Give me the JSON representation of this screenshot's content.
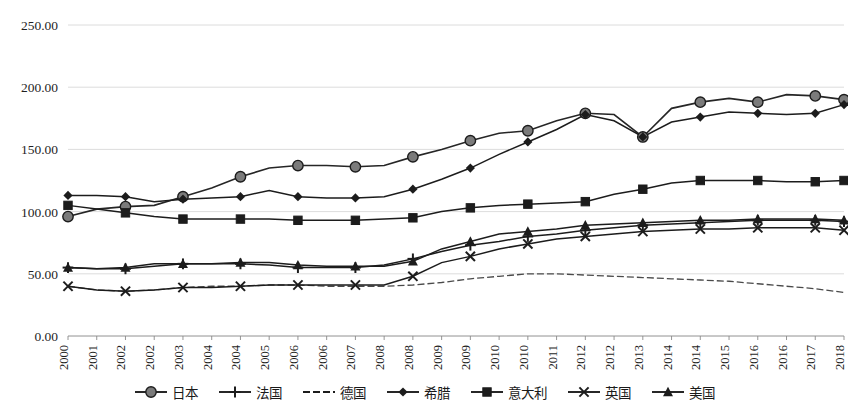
{
  "chart_data": {
    "type": "line",
    "title": "",
    "subtitle": "",
    "xlabel": "",
    "ylabel": "",
    "ylim": [
      0,
      250
    ],
    "ytick_step": 50,
    "ytick_labels": [
      "0.00",
      "50.00",
      "100.00",
      "150.00",
      "200.00",
      "250.00"
    ],
    "grid": true,
    "legend_position": "bottom",
    "marker_interval": 2,
    "categories": [
      "2000",
      "2001",
      "2002",
      "2002",
      "2003",
      "2004",
      "2004",
      "2005",
      "2006",
      "2006",
      "2007",
      "2008",
      "2008",
      "2009",
      "2009",
      "2010",
      "2010",
      "2011",
      "2012",
      "2012",
      "2013",
      "2014",
      "2014",
      "2015",
      "2016",
      "2016",
      "2017",
      "2018"
    ],
    "series": [
      {
        "name": "日本",
        "marker": "circle",
        "color": "#777777",
        "values": [
          96,
          102,
          104,
          105,
          112,
          119,
          128,
          135,
          137,
          137,
          136,
          137,
          144,
          150,
          157,
          163,
          165,
          173,
          179,
          178,
          160,
          183,
          188,
          191,
          188,
          194,
          193,
          190
        ]
      },
      {
        "name": "法国",
        "marker": "plus",
        "color": "#1c1c1c",
        "values": [
          55,
          54,
          54,
          56,
          58,
          58,
          58,
          57,
          55,
          55,
          55,
          57,
          62,
          68,
          73,
          76,
          80,
          82,
          85,
          87,
          89,
          90,
          91,
          92,
          93,
          93,
          93,
          92
        ]
      },
      {
        "name": "德国",
        "marker": "none",
        "color": "#4a4a4a",
        "values": [
          40,
          37,
          36,
          37,
          39,
          40,
          40,
          41,
          41,
          40,
          40,
          40,
          41,
          43,
          46,
          48,
          50,
          50,
          49,
          48,
          47,
          46,
          45,
          44,
          42,
          40,
          38,
          35
        ]
      },
      {
        "name": "希腊",
        "marker": "diamond",
        "color": "#1c1c1c",
        "values": [
          113,
          113,
          112,
          108,
          110,
          111,
          112,
          117,
          112,
          111,
          111,
          112,
          118,
          126,
          135,
          146,
          156,
          166,
          178,
          173,
          160,
          172,
          176,
          180,
          179,
          178,
          179,
          186
        ]
      },
      {
        "name": "意大利",
        "marker": "square",
        "color": "#1c1c1c",
        "values": [
          105,
          102,
          99,
          96,
          94,
          94,
          94,
          94,
          93,
          93,
          93,
          94,
          95,
          100,
          103,
          105,
          106,
          107,
          108,
          114,
          118,
          123,
          125,
          125,
          125,
          124,
          124,
          125
        ]
      },
      {
        "name": "英国",
        "marker": "x",
        "color": "#1c1c1c",
        "values": [
          40,
          37,
          36,
          37,
          39,
          39,
          40,
          41,
          41,
          41,
          41,
          41,
          48,
          59,
          64,
          70,
          74,
          78,
          80,
          82,
          84,
          85,
          86,
          86,
          87,
          87,
          87,
          85
        ]
      },
      {
        "name": "美国",
        "marker": "triangle",
        "color": "#1c1c1c",
        "values": [
          55,
          54,
          55,
          58,
          58,
          58,
          59,
          59,
          57,
          56,
          56,
          56,
          60,
          70,
          76,
          82,
          84,
          86,
          89,
          90,
          91,
          92,
          93,
          93,
          94,
          94,
          94,
          93
        ]
      }
    ]
  },
  "legend": {
    "items": [
      {
        "label": "日本",
        "marker": "circle"
      },
      {
        "label": "法国",
        "marker": "plus"
      },
      {
        "label": "德国",
        "marker": "none"
      },
      {
        "label": "希腊",
        "marker": "diamond"
      },
      {
        "label": "意大利",
        "marker": "square"
      },
      {
        "label": "英国",
        "marker": "x"
      },
      {
        "label": "美国",
        "marker": "triangle"
      }
    ]
  }
}
